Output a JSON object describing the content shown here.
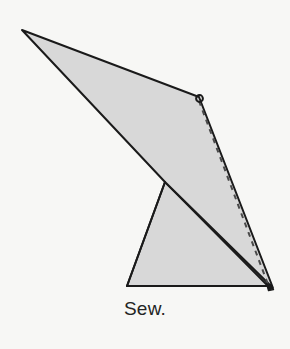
{
  "figure": {
    "kind": "craft-instruction-diagram",
    "caption": "Sew.",
    "background_color": "#f7f7f5",
    "fill_color": "#d8d8d8",
    "stroke_color": "#1a1a1a",
    "dash_color": "#3a3a3a",
    "parts": [
      {
        "name": "sail-panel",
        "label": "large folded fabric panel",
        "points": "22,30 199,97 273,288 165,182",
        "fill": "#d8d8d8",
        "stroke": "#1a1a1a",
        "stroke_width": 2
      },
      {
        "name": "base-panel",
        "label": "lower fabric base panel",
        "points": "165,182 268,286 127,286",
        "fill": "#d8d8d8",
        "stroke": "#1a1a1a",
        "stroke_width": 2
      }
    ],
    "stitch_line": {
      "name": "stitch-guide",
      "label": "dashed sewing line",
      "from": "199,101",
      "to": "269,287",
      "dash_pattern": "5 5",
      "color": "#4a4a4a",
      "stroke_width": 2
    },
    "hook": {
      "name": "needle-loop",
      "label": "small thread loop at top corner",
      "cx": 199.5,
      "cy": 98.5,
      "r": 3.4,
      "color": "#1a1a1a"
    },
    "tip": {
      "name": "needle-point",
      "label": "thread exit point at bottom corner",
      "cx": 270.5,
      "cy": 286.0,
      "r": 3.0,
      "color": "#1a1a1a"
    }
  }
}
